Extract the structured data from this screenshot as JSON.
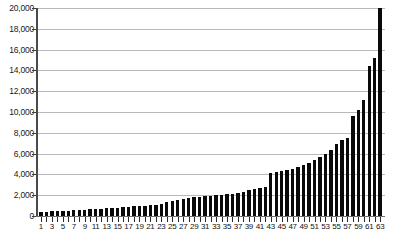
{
  "chart_data": {
    "type": "bar",
    "title": "",
    "subtitle": "",
    "xlabel": "",
    "ylabel": "",
    "ylim": [
      0,
      20000
    ],
    "ytick_values": [
      0,
      2000,
      4000,
      6000,
      8000,
      10000,
      12000,
      14000,
      16000,
      18000,
      20000
    ],
    "ytick_labels": [
      "0",
      "2,000",
      "4,000",
      "6,000",
      "8,000",
      "10,000",
      "12,000",
      "14,000",
      "16,000",
      "18,000",
      "20,000"
    ],
    "grid": true,
    "legend": null,
    "bar_color": "#0a0a0a",
    "grid_color": "#b9b9b9",
    "axis_color": "#4a4a4a",
    "categories": [
      1,
      2,
      3,
      4,
      5,
      6,
      7,
      8,
      9,
      10,
      11,
      12,
      13,
      14,
      15,
      16,
      17,
      18,
      19,
      20,
      21,
      22,
      23,
      24,
      25,
      26,
      27,
      28,
      29,
      30,
      31,
      32,
      33,
      34,
      35,
      36,
      37,
      38,
      39,
      40,
      41,
      42,
      43,
      44,
      45,
      46,
      47,
      48,
      49,
      50,
      51,
      52,
      53,
      54,
      55,
      56,
      57,
      58,
      59,
      60,
      61,
      62,
      63
    ],
    "xtick_labels": [
      "1",
      "3",
      "5",
      "7",
      "9",
      "11",
      "13",
      "15",
      "17",
      "19",
      "21",
      "23",
      "25",
      "27",
      "29",
      "31",
      "33",
      "35",
      "37",
      "39",
      "41",
      "43",
      "45",
      "47",
      "49",
      "51",
      "53",
      "55",
      "57",
      "59",
      "61",
      "63"
    ],
    "values": [
      380,
      420,
      450,
      470,
      500,
      530,
      560,
      580,
      600,
      640,
      680,
      700,
      730,
      760,
      800,
      840,
      880,
      920,
      960,
      1000,
      1050,
      1100,
      1200,
      1300,
      1400,
      1500,
      1600,
      1700,
      1800,
      1850,
      1900,
      1950,
      2000,
      2050,
      2100,
      2150,
      2250,
      2350,
      2500,
      2600,
      2700,
      2800,
      4100,
      4200,
      4300,
      4400,
      4500,
      4700,
      4900,
      5100,
      5400,
      5700,
      6000,
      6300,
      6900,
      7300,
      7500,
      9600,
      10200,
      11200,
      14400,
      15200,
      20000
    ]
  }
}
